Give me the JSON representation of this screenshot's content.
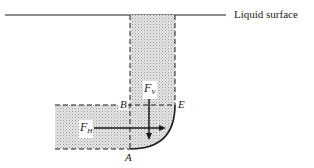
{
  "diagram": {
    "surface_label": "Liquid surface",
    "points": {
      "A": "A",
      "B": "B",
      "E": "E"
    },
    "forces": {
      "horizontal": {
        "symbol": "F",
        "subscript": "H"
      },
      "vertical": {
        "symbol": "F",
        "subscript": "V"
      }
    },
    "colors": {
      "line": "#1a1a1a",
      "fill": "#d8d8d8",
      "background": "#ffffff"
    }
  }
}
